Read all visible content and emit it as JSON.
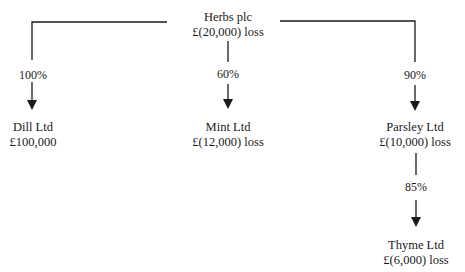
{
  "diagram": {
    "type": "group-structure",
    "parent": {
      "name": "Herbs plc",
      "result": "£(20,000) loss"
    },
    "subsidiaries": [
      {
        "name": "Dill Ltd",
        "result": "£100,000",
        "holding": "100%",
        "held_by": "Herbs plc"
      },
      {
        "name": "Mint Ltd",
        "result": "£(12,000) loss",
        "holding": "60%",
        "held_by": "Herbs plc"
      },
      {
        "name": "Parsley Ltd",
        "result": "£(10,000) loss",
        "holding": "90%",
        "held_by": "Herbs plc"
      },
      {
        "name": "Thyme Ltd",
        "result": "£(6,000) loss",
        "holding": "85%",
        "held_by": "Parsley Ltd"
      }
    ],
    "colors": {
      "line": "#1a1a1a",
      "text": "#1a1a1a",
      "background": "#ffffff"
    }
  }
}
